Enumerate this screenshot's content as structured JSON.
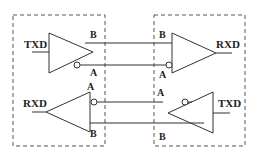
{
  "diagram": {
    "type": "RS-485 differential transceiver link",
    "colors": {
      "line": "#333333",
      "dash": "#555555",
      "background": "#ffffff"
    },
    "nodes": {
      "left": {
        "driver": {
          "input_label": "TXD",
          "out_b": "B",
          "out_a": "A"
        },
        "receiver": {
          "output_label": "RXD",
          "in_a": "A",
          "in_b": "B"
        }
      },
      "right": {
        "receiver": {
          "output_label": "RXD",
          "in_b": "B",
          "in_a": "A"
        },
        "driver": {
          "input_label": "TXD",
          "out_a": "A",
          "out_b": "B"
        }
      }
    }
  }
}
